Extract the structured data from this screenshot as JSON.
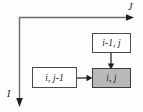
{
  "diagram": {
    "background_color": "#fdfdfd",
    "axes": {
      "horizontal": {
        "label": "J",
        "name": "j-axis",
        "direction": "right",
        "arrow": "arrowhead-right"
      },
      "vertical": {
        "label": "I",
        "name": "i-axis",
        "direction": "down",
        "arrow": "arrowhead-down"
      },
      "line_color": "#6e6e6e",
      "origin_corner": "top-left"
    },
    "nodes": [
      {
        "id": "top",
        "label": "i-1, j",
        "name": "node-i-minus-1-j",
        "fill": "#ffffff",
        "border_color": "#4a4a4a",
        "shaded": false
      },
      {
        "id": "left",
        "label": "i, j-1",
        "name": "node-i-j-minus-1",
        "fill": "#ffffff",
        "border_color": "#4a4a4a",
        "shaded": false
      },
      {
        "id": "center",
        "label": "i, j",
        "name": "node-i-j",
        "fill": "#b9b9b9",
        "border_color": "#3a3a3a",
        "shaded": true
      }
    ],
    "arrows": [
      {
        "name": "arrow-top-to-center",
        "from": "i-1, j",
        "to": "i, j",
        "direction": "down",
        "color": "#2a2a2a"
      },
      {
        "name": "arrow-left-to-center",
        "from": "i, j-1",
        "to": "i, j",
        "direction": "right",
        "color": "#2a2a2a"
      }
    ]
  }
}
